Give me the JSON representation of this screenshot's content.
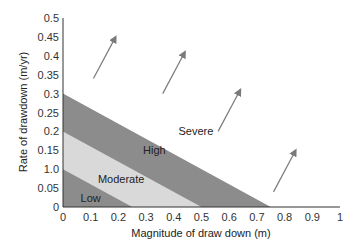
{
  "chart_data": {
    "type": "area",
    "title": "",
    "xlabel": "Magnitude of draw down (m)",
    "ylabel": "Rate of drawdown (m/yr)",
    "xlim": [
      0,
      1
    ],
    "ylim": [
      0,
      0.5
    ],
    "grid": false,
    "x_ticks": [
      "0",
      "0.1",
      "0.2",
      "0.3",
      "0.4",
      "0.5",
      "0.6",
      "0.7",
      "0.8",
      "0.9",
      "1"
    ],
    "y_ticks": [
      "0",
      "0.05",
      "1.0",
      "0.15",
      "0.2",
      "0.25",
      "0.3",
      "0.35",
      "0.4",
      "0.45",
      "0.5"
    ],
    "regions": [
      {
        "name": "Low",
        "boundary": {
          "y_intercept": 0.1,
          "x_intercept": 0.25
        },
        "color": "#8c8c8c",
        "label_pos": [
          0.1,
          0.025
        ]
      },
      {
        "name": "Moderate",
        "boundary": {
          "y_intercept": 0.2,
          "x_intercept": 0.5
        },
        "color": "#d9d9d9",
        "label_pos": [
          0.21,
          0.075
        ]
      },
      {
        "name": "High",
        "boundary": {
          "y_intercept": 0.3,
          "x_intercept": 0.75
        },
        "color": "#8c8c8c",
        "label_pos": [
          0.33,
          0.15
        ]
      },
      {
        "name": "Severe",
        "boundary": null,
        "color": "#ffffff",
        "label_pos": [
          0.48,
          0.2
        ]
      }
    ],
    "arrows": [
      {
        "from": [
          0.11,
          0.34
        ],
        "to": [
          0.19,
          0.45
        ]
      },
      {
        "from": [
          0.36,
          0.3
        ],
        "to": [
          0.44,
          0.41
        ]
      },
      {
        "from": [
          0.56,
          0.2
        ],
        "to": [
          0.64,
          0.31
        ]
      },
      {
        "from": [
          0.76,
          0.04
        ],
        "to": [
          0.84,
          0.15
        ]
      }
    ],
    "colors": {
      "dark_band": "#8c8c8c",
      "light_band": "#d9d9d9",
      "arrow": "#7a7a7a",
      "axis": "#333333"
    }
  }
}
